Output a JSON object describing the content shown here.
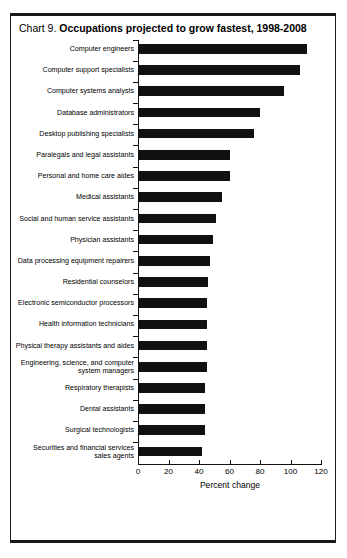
{
  "chart_data": {
    "type": "bar",
    "orientation": "horizontal",
    "title_prefix": "Chart 9.",
    "title_main": "Occupations projected to grow fastest, 1998-2008",
    "xlabel": "Percent change",
    "ylabel": "",
    "xlim": [
      0,
      120
    ],
    "xticks": [
      0,
      20,
      40,
      60,
      80,
      100,
      120
    ],
    "xtick_labels": [
      "0",
      "20",
      "40",
      "60",
      "80",
      "100",
      "120"
    ],
    "grid": false,
    "legend": false,
    "bar_color": "#111111",
    "categories": [
      "Computer engineers",
      "Computer support specialists",
      "Computer systems analysts",
      "Database administrators",
      "Desktop publishing specialists",
      "Paralegals and legal assistants",
      "Personal and home care aides",
      "Medical assistants",
      "Social and human service assistants",
      "Physician assistants",
      "Data processing equipment repairers",
      "Residential counselors",
      "Electronic semiconductor processors",
      "Health information technicians",
      "Physical therapy assistants and aides",
      "Engineering, science, and computer\nsystem managers",
      "Respiratory therapists",
      "Dental assistants",
      "Surgical technologists",
      "Securities and financial services\nsales agents"
    ],
    "values": [
      111,
      106,
      96,
      80,
      76,
      60,
      60,
      55,
      51,
      49,
      47,
      46,
      45,
      45,
      45,
      45,
      44,
      44,
      44,
      42
    ]
  }
}
